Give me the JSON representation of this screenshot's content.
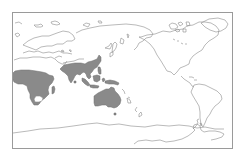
{
  "map": {
    "projection": "Pacific-centered world map",
    "colors": {
      "background": "#ffffff",
      "frame": "#9a9a9a",
      "coastline": "#8c8c8c",
      "distribution_fill": "#8a8a8a"
    },
    "distribution_regions": [
      "Sub-Saharan Africa",
      "Madagascar",
      "Indian subcontinent",
      "Indochina and southern China",
      "Philippines",
      "Indonesia",
      "New Guinea",
      "Australia"
    ]
  }
}
